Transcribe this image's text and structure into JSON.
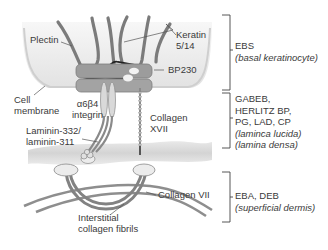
{
  "figure": {
    "colors": {
      "cell": "#e9e9e9",
      "cell_edge": "#bdbdbd",
      "filament": "#7b7b7b",
      "plaque": "#9a9a9a",
      "lamina_densa": "#d6d6d6",
      "collagen": "#8a8a8a",
      "bracket": "#444444",
      "text": "#3a3a3a"
    }
  },
  "structure_labels": {
    "plectin": "Plectin",
    "keratin_line1": "Keratin",
    "keratin_line2": "5/14",
    "bp230": "BP230",
    "cell_line1": "Cell",
    "cell_line2": "membrane",
    "integrin_line1": "α6β4",
    "integrin_line2": "integrin",
    "collagen17_line1": "Collagen",
    "collagen17_line2": "XVII",
    "laminin_line1": "Laminin-332/",
    "laminin_line2": "laminin-311",
    "collagen7": "Collagen VII",
    "fibrils_line1": "Interstitial",
    "fibrils_line2": "collagen fibrils"
  },
  "zones": [
    {
      "diseases": [
        "EBS"
      ],
      "layers": [
        "(basal keratinocyte)"
      ]
    },
    {
      "diseases": [
        "GABEB,",
        "HERLITZ BP,",
        "PG, LAD, CP"
      ],
      "layers": [
        "(laminca lucida)",
        "(lamina densa)"
      ]
    },
    {
      "diseases": [
        "EBA, DEB"
      ],
      "layers": [
        "(superficial dermis)"
      ]
    }
  ]
}
